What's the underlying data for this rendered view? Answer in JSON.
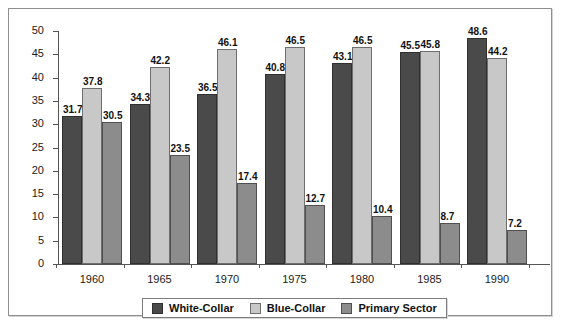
{
  "chart_data": {
    "type": "bar",
    "title": "",
    "subtitle": "",
    "xlabel": "",
    "ylabel": "",
    "categories": [
      "1960",
      "1965",
      "1970",
      "1975",
      "1980",
      "1985",
      "1990"
    ],
    "series": [
      {
        "name": "White-Collar",
        "color": "#4a4a4a",
        "values": [
          31.7,
          34.3,
          36.5,
          40.8,
          43.1,
          45.5,
          48.6
        ]
      },
      {
        "name": "Blue-Collar",
        "color": "#c8c8c8",
        "values": [
          37.8,
          42.2,
          46.1,
          46.5,
          46.5,
          45.8,
          44.2
        ]
      },
      {
        "name": "Primary Sector",
        "color": "#8c8c8c",
        "values": [
          30.5,
          23.5,
          17.4,
          12.7,
          10.4,
          8.7,
          7.2
        ]
      }
    ],
    "ylim": [
      0,
      50
    ],
    "ytick_step": 5,
    "yticks": [
      "0",
      "5",
      "10",
      "15",
      "20",
      "25",
      "30",
      "35",
      "40",
      "45",
      "50"
    ],
    "grid": false,
    "legend_position": "bottom",
    "data_labels": true
  },
  "legend": {
    "items": [
      {
        "label": "White-Collar"
      },
      {
        "label": "Blue-Collar"
      },
      {
        "label": "Primary Sector"
      }
    ]
  }
}
